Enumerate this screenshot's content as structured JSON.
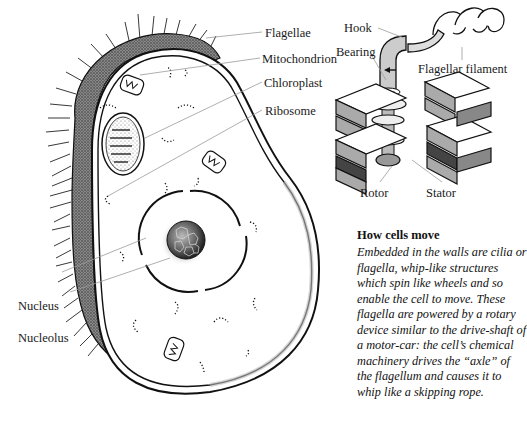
{
  "cell_diagram": {
    "labels": {
      "flagellae": "Flagellae",
      "mitochondrion": "Mitochondrion",
      "chloroplast": "Chloroplast",
      "ribosome": "Ribosome",
      "nucleus": "Nucleus",
      "nucleolus": "Nucleolus"
    }
  },
  "motor_diagram": {
    "labels": {
      "hook": "Hook",
      "bearing": "Bearing",
      "flagellar_filament": "Flagellar filament",
      "rotor": "Rotor",
      "stator": "Stator"
    }
  },
  "caption": {
    "title": "How cells move",
    "body": "Embedded in the walls are cilia or flagella, whip-like structures which spin like wheels and so enable the cell to move. These flagella are powered by a rotary device similar to the drive-shaft of a motor-car: the cell’s chemical machinery drives the “axle” of the flagellum and causes it to whip like a skipping rope."
  },
  "colors": {
    "ink": "#111111",
    "stipple": "#555555",
    "leader_line": "#9a9a9a",
    "background": "#ffffff"
  }
}
